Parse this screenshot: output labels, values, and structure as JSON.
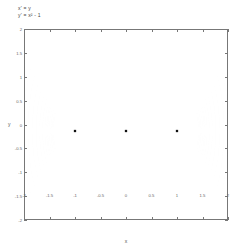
{
  "equations": {
    "line1": "x' = y",
    "line2": "y' = x² - 1"
  },
  "axes": {
    "xlabel": "x",
    "ylabel": "y",
    "xticks": [
      "-2",
      "-1.5",
      "-1",
      "-0.5",
      "0",
      "0.5",
      "1",
      "1.5",
      "2"
    ],
    "yticks": [
      "2",
      "1.5",
      "1",
      "0.5",
      "0",
      "-0.5",
      "-1",
      "-1.5",
      "-2"
    ]
  },
  "chart_data": {
    "type": "line",
    "title": "",
    "xlabel": "x",
    "ylabel": "y",
    "xlim": [
      -2,
      2
    ],
    "ylim": [
      -2,
      2
    ],
    "grid": false,
    "legend": "none",
    "equilibria": [
      {
        "name": "saddle-left",
        "x": -1,
        "y": 0,
        "type": "saddle"
      },
      {
        "name": "center",
        "x": 0,
        "y": 0,
        "type": "center"
      },
      {
        "name": "saddle-right",
        "x": 1,
        "y": 0,
        "type": "saddle"
      }
    ],
    "x_ticks": [
      -2,
      -1.5,
      -1,
      -0.5,
      0,
      0.5,
      1,
      1.5,
      2
    ],
    "y_ticks": [
      -2,
      -1.5,
      -1,
      -0.5,
      0,
      0.5,
      1,
      1.5,
      2
    ],
    "series": [
      {
        "name": "closed-orbit-1",
        "energy": 0.02
      },
      {
        "name": "closed-orbit-2",
        "energy": 0.06
      },
      {
        "name": "closed-orbit-3",
        "energy": 0.12
      },
      {
        "name": "closed-orbit-4",
        "energy": 0.18
      },
      {
        "name": "separatrix",
        "energy": 0.25
      },
      {
        "name": "outer-orbit-1",
        "energy": 0.35
      },
      {
        "name": "outer-orbit-2",
        "energy": 0.55
      },
      {
        "name": "outer-orbit-3",
        "energy": 0.85
      },
      {
        "name": "outer-orbit-4",
        "energy": 1.3
      },
      {
        "name": "outer-orbit-5",
        "energy": 1.9
      }
    ]
  }
}
